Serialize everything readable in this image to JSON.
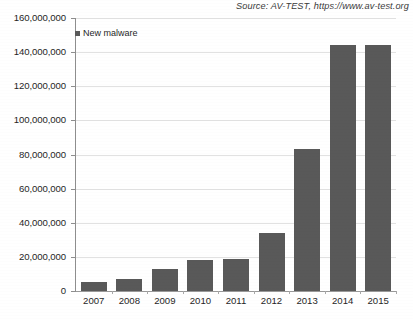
{
  "source": {
    "text": "Source: AV-TEST, https://www.av-test.org"
  },
  "legend": {
    "label": "New malware",
    "marker_color": "#595959",
    "position": "top-left-inside"
  },
  "chart_data": {
    "type": "bar",
    "title": "",
    "subtitle": "",
    "xlabel": "",
    "ylabel": "",
    "categories": [
      "2007",
      "2008",
      "2009",
      "2010",
      "2011",
      "2012",
      "2013",
      "2014",
      "2015"
    ],
    "series": [
      {
        "name": "New malware",
        "values": [
          5500000,
          7000000,
          13000000,
          18000000,
          19000000,
          34000000,
          83000000,
          144000000,
          144000000
        ],
        "color": "#595959"
      }
    ],
    "ylim": [
      0,
      160000000
    ],
    "ytick_values": [
      0,
      20000000,
      40000000,
      60000000,
      80000000,
      100000000,
      120000000,
      140000000,
      160000000
    ],
    "ytick_labels": [
      "0",
      "20,000,000",
      "40,000,000",
      "60,000,000",
      "80,000,000",
      "100,000,000",
      "120,000,000",
      "140,000,000",
      "160,000,000"
    ],
    "grid": true,
    "grid_axis": "y",
    "grid_color": "#e2e2e2",
    "legend": "New malware",
    "annotations": [
      "Source: AV-TEST, https://www.av-test.org"
    ]
  }
}
